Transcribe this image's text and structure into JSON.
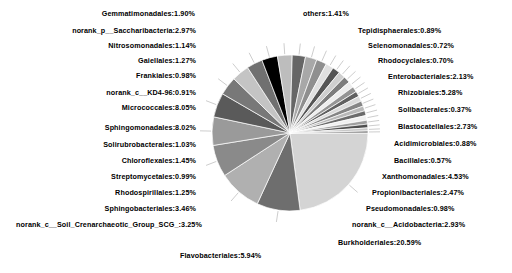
{
  "chart_data": {
    "type": "pie",
    "title": "",
    "subtitle": "",
    "xlabel": "",
    "ylabel": "",
    "legend_position": "labels-with-leader-lines",
    "grid": false,
    "value_unit": "percent",
    "label_format": "{name}:{value}%",
    "total": 100.0,
    "start_angle_deg": 0,
    "direction": "clockwise",
    "categories": [
      "Burkholderiales",
      "Micrococcales",
      "Sphingomonadales",
      "Flavobacteriales",
      "Rhizobiales",
      "Xanthomonadales",
      "Sphingobacteriales",
      "norank_c__Soil_Crenarchaeotic_Group_SCG_",
      "norank_p__Saccharibacteria",
      "norank_c__Acidobacteria",
      "Blastocatellales",
      "Propionibacteriales",
      "Enterobacteriales",
      "Gemmatimonadales",
      "others",
      "Chloroflexales",
      "Rhodospirillales",
      "Gaiellales",
      "Nitrosomonadales",
      "Solirubrobacterales",
      "Streptomycetales",
      "Frankiales",
      "Pseudomonadales",
      "norank_c__KD4-96",
      "Acidimicrobiales",
      "Tepidisphaerales",
      "Selenomonadales",
      "Rhodocyclales",
      "Bacillales",
      "Solibacterales"
    ],
    "values": [
      20.59,
      8.05,
      8.02,
      5.94,
      5.28,
      4.53,
      3.46,
      3.25,
      2.97,
      2.93,
      2.73,
      2.47,
      2.13,
      1.9,
      1.41,
      1.45,
      1.25,
      1.27,
      1.14,
      1.03,
      0.99,
      0.98,
      0.98,
      0.91,
      0.88,
      0.89,
      0.72,
      0.7,
      0.57,
      0.37
    ],
    "slices": [
      {
        "name": "Burkholderiales",
        "value": 20.59,
        "color": "#d4d4d4",
        "label": "Burkholderiales:20.59%"
      },
      {
        "name": "Micrococcales",
        "value": 8.05,
        "color": "#6e6e6e",
        "label": "Micrococcales:8.05%"
      },
      {
        "name": "Sphingomonadales",
        "value": 8.02,
        "color": "#b0b0b0",
        "label": "Sphingomonadales:8.02%"
      },
      {
        "name": "Flavobacteriales",
        "value": 5.94,
        "color": "#8a8a8a",
        "label": "Flavobacteriales:5.94%"
      },
      {
        "name": "Rhizobiales",
        "value": 5.28,
        "color": "#9a9a9a",
        "label": "Rhizobiales:5.28%"
      },
      {
        "name": "Xanthomonadales",
        "value": 4.53,
        "color": "#5a5a5a",
        "label": "Xanthomonadales:4.53%"
      },
      {
        "name": "Sphingobacteriales",
        "value": 3.46,
        "color": "#787878",
        "label": "Sphingobacteriales:3.46%"
      },
      {
        "name": "norank_c__Soil_Crenarchaeotic_Group_SCG_",
        "value": 3.25,
        "color": "#c4c4c4",
        "label": "norank_c__Soil_Crenarchaeotic_Group_SCG_:3.25%"
      },
      {
        "name": "norank_p__Saccharibacteria",
        "value": 2.97,
        "color": "#707070",
        "label": "norank_p__Saccharibacteria:2.97%"
      },
      {
        "name": "norank_c__Acidobacteria",
        "value": 2.93,
        "color": "#000000",
        "label": "norank_c__Acidobacteria:2.93%"
      },
      {
        "name": "Blastocatellales",
        "value": 2.73,
        "color": "#bdbdbd",
        "label": "Blastocatellales:2.73%"
      },
      {
        "name": "Propionibacteriales",
        "value": 2.47,
        "color": "#666666",
        "label": "Propionibacteriales:2.47%"
      },
      {
        "name": "Enterobacteriales",
        "value": 2.13,
        "color": "#a8a8a8",
        "label": "Enterobacteriales:2.13%"
      },
      {
        "name": "Gemmatimonadales",
        "value": 1.9,
        "color": "#8f8f8f",
        "label": "Gemmatimonadales:1.90%"
      },
      {
        "name": "Chloroflexales",
        "value": 1.45,
        "color": "#e0e0e0",
        "label": "Chloroflexales:1.45%"
      },
      {
        "name": "others",
        "value": 1.41,
        "color": "#555555",
        "label": "others:1.41%"
      },
      {
        "name": "Gaiellales",
        "value": 1.27,
        "color": "#cfcfcf",
        "label": "Gaiellales:1.27%"
      },
      {
        "name": "Rhodospirillales",
        "value": 1.25,
        "color": "#7d7d7d",
        "label": "Rhodospirillales:1.25%"
      },
      {
        "name": "Nitrosomonadales",
        "value": 1.14,
        "color": "#ededed",
        "label": "Nitrosomonadales:1.14%"
      },
      {
        "name": "Solirubrobacterales",
        "value": 1.03,
        "color": "#949494",
        "label": "Solirubrobacterales:1.03%"
      },
      {
        "name": "Streptomycetales",
        "value": 0.99,
        "color": "#616161",
        "label": "Streptomycetales:0.99%"
      },
      {
        "name": "Frankiales",
        "value": 0.98,
        "color": "#dadada",
        "label": "Frankiales:0.98%"
      },
      {
        "name": "Pseudomonadales",
        "value": 0.98,
        "color": "#858585",
        "label": "Pseudomonadales:0.98%"
      },
      {
        "name": "norank_c__KD4-96",
        "value": 0.91,
        "color": "#b8b8b8",
        "label": "norank_c__KD4-96:0.91%"
      },
      {
        "name": "Tepidisphaerales",
        "value": 0.89,
        "color": "#6b6b6b",
        "label": "Tepidisphaerales:0.89%"
      },
      {
        "name": "Acidimicrobiales",
        "value": 0.88,
        "color": "#f0f0f0",
        "label": "Acidimicrobiales:0.88%"
      },
      {
        "name": "Selenomonadales",
        "value": 0.72,
        "color": "#9f9f9f",
        "label": "Selenomonadales:0.72%"
      },
      {
        "name": "Rhodocyclales",
        "value": 0.7,
        "color": "#4f4f4f",
        "label": "Rhodocyclales:0.70%"
      },
      {
        "name": "Bacillales",
        "value": 0.57,
        "color": "#c8c8c8",
        "label": "Bacillales:0.57%"
      },
      {
        "name": "Solibacterales",
        "value": 0.37,
        "color": "#737373",
        "label": "Solibacterales:0.37%"
      }
    ]
  },
  "labels": {
    "top": [
      {
        "id": "gemmatimonadales",
        "text": "Gemmatimonadales:1.90%"
      },
      {
        "id": "others",
        "text": "others:1.41%"
      }
    ],
    "left": [
      {
        "id": "norank-saccharibacteria",
        "text": "norank_p__Saccharibacteria:2.97%"
      },
      {
        "id": "nitrosomonadales",
        "text": "Nitrosomonadales:1.14%"
      },
      {
        "id": "gaiellales",
        "text": "Gaiellales:1.27%"
      },
      {
        "id": "frankiales",
        "text": "Frankiales:0.98%"
      },
      {
        "id": "norank-kd4-96",
        "text": "norank_c__KD4-96:0.91%"
      },
      {
        "id": "micrococcales",
        "text": "Micrococcales:8.05%"
      },
      {
        "id": "sphingomonadales",
        "text": "Sphingomonadales:8.02%"
      },
      {
        "id": "solirubrobacterales",
        "text": "Solirubrobacterales:1.03%"
      },
      {
        "id": "chloroflexales",
        "text": "Chloroflexales:1.45%"
      },
      {
        "id": "streptomycetales",
        "text": "Streptomycetales:0.99%"
      },
      {
        "id": "rhodospirillales",
        "text": "Rhodospirillales:1.25%"
      },
      {
        "id": "sphingobacteriales",
        "text": "Sphingobacteriales:3.46%"
      },
      {
        "id": "norank-soil-scg",
        "text": "norank_c__Soil_Crenarchaeotic_Group_SCG_:3.25%"
      }
    ],
    "bottom": [
      {
        "id": "flavobacteriales",
        "text": "Flavobacteriales:5.94%"
      }
    ],
    "right": [
      {
        "id": "tepidisphaerales",
        "text": "Tepidisphaerales:0.89%"
      },
      {
        "id": "selenomonadales",
        "text": "Selenomonadales:0.72%"
      },
      {
        "id": "rhodocyclales",
        "text": "Rhodocyclales:0.70%"
      },
      {
        "id": "enterobacteriales",
        "text": "Enterobacteriales:2.13%"
      },
      {
        "id": "rhizobiales",
        "text": "Rhizobiales:5.28%"
      },
      {
        "id": "solibacterales",
        "text": "Solibacterales:0.37%"
      },
      {
        "id": "blastocatellales",
        "text": "Blastocatellales:2.73%"
      },
      {
        "id": "acidimicrobiales",
        "text": "Acidimicrobiales:0.88%"
      },
      {
        "id": "bacillales",
        "text": "Bacillales:0.57%"
      },
      {
        "id": "xanthomonadales",
        "text": "Xanthomonadales:4.53%"
      },
      {
        "id": "propionibacteriales",
        "text": "Propionibacteriales:2.47%"
      },
      {
        "id": "pseudomonadales",
        "text": "Pseudomonadales:0.98%"
      },
      {
        "id": "norank-acidobacteria",
        "text": "norank_c__Acidobacteria:2.93%"
      },
      {
        "id": "burkholderiales",
        "text": "Burkholderiales:20.59%"
      }
    ]
  },
  "geometry": {
    "center_x": 290,
    "center_y": 133,
    "radius": 78
  },
  "colors": {
    "background": "#ffffff",
    "text": "#000000",
    "leader_line": "#9a9a9a",
    "slice_edge": "#ffffff"
  }
}
